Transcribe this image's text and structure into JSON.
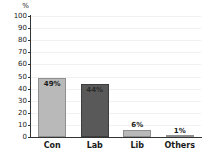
{
  "chart_data": {
    "type": "bar",
    "title": "",
    "xlabel": "",
    "ylabel": "%",
    "unit_label": "%",
    "categories": [
      "Con",
      "Lab",
      "Lib",
      "Others"
    ],
    "values": [
      49,
      44,
      6,
      1
    ],
    "data_labels": [
      "49%",
      "44%",
      "6%",
      "1%"
    ],
    "ylim": [
      0,
      100
    ],
    "yticks": [
      0,
      10,
      20,
      30,
      40,
      50,
      60,
      70,
      80,
      90,
      100
    ],
    "ytick_labels": [
      "0",
      "10",
      "20",
      "30",
      "40",
      "50",
      "60",
      "70",
      "80",
      "90",
      "100"
    ],
    "grid": true,
    "legend": "none",
    "bar_colors": [
      "#b9b9b9",
      "#595959",
      "#b9b9b9",
      "#b9b9b9"
    ]
  }
}
